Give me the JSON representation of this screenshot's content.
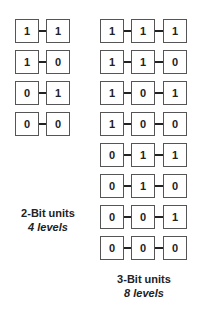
{
  "two_bit": {
    "rows": [
      [
        "1",
        "1"
      ],
      [
        "1",
        "0"
      ],
      [
        "0",
        "1"
      ],
      [
        "0",
        "0"
      ]
    ],
    "caption": "2-Bit units",
    "levels": "4 levels"
  },
  "three_bit": {
    "rows": [
      [
        "1",
        "1",
        "1"
      ],
      [
        "1",
        "1",
        "0"
      ],
      [
        "1",
        "0",
        "1"
      ],
      [
        "1",
        "0",
        "0"
      ],
      [
        "0",
        "1",
        "1"
      ],
      [
        "0",
        "1",
        "0"
      ],
      [
        "0",
        "0",
        "1"
      ],
      [
        "0",
        "0",
        "0"
      ]
    ],
    "caption": "3-Bit units",
    "levels": "8 levels"
  }
}
